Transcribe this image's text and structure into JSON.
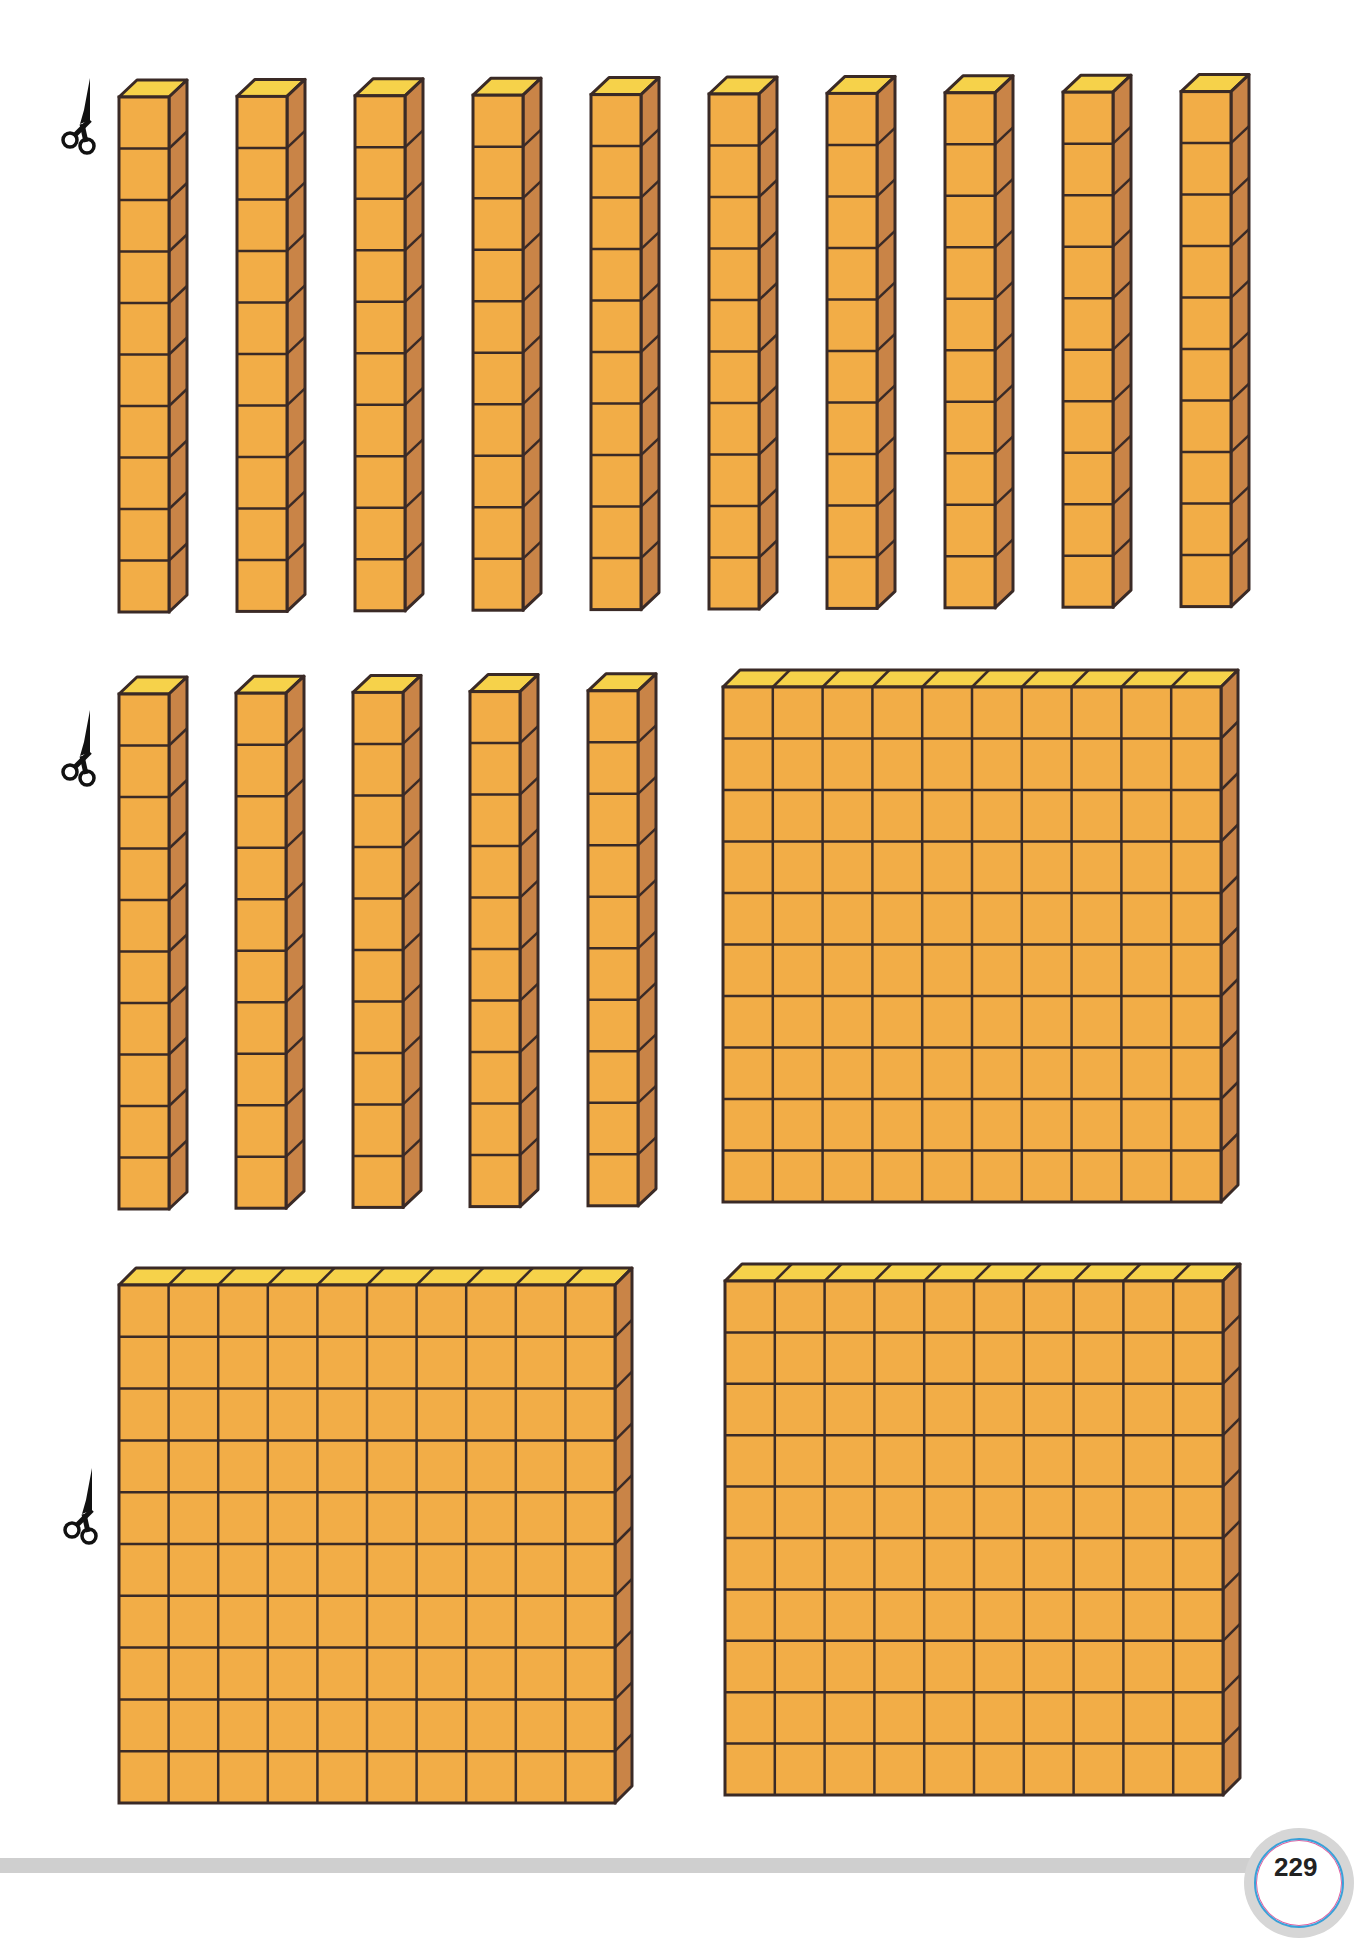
{
  "page": {
    "page_number": "229"
  },
  "colors": {
    "front": "#F2AD47",
    "top": "#F6D24A",
    "side": "#C98447",
    "outline": "#3A2A26",
    "background": "#FFFFFF",
    "band": "#CFCFCF"
  },
  "icons": {
    "scissors": "scissors-icon"
  },
  "blocks": {
    "rods_row1": {
      "count": 10,
      "units_each": 10
    },
    "rods_row2": {
      "count": 5,
      "units_each": 10
    },
    "flats": {
      "count": 3,
      "grid": "10x10",
      "units_each": 100
    }
  }
}
